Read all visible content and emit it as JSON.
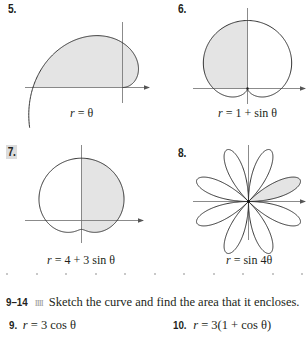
{
  "figures": [
    {
      "number": "5.",
      "caption_lhs": "r",
      "caption_rhs": " = θ",
      "equation": "r = θ",
      "shaded": "spiral region from θ=0 to θ=π"
    },
    {
      "number": "6.",
      "caption_lhs": "r",
      "caption_rhs": " = 1 + sin θ",
      "equation": "r = 1 + sin θ",
      "shaded": "left half (second quadrant part)"
    },
    {
      "number": "7.",
      "caption_lhs": "r",
      "caption_rhs": " = 4 + 3 sin θ",
      "equation": "r = 4 + 3 sin θ",
      "shaded": "right half"
    },
    {
      "number": "8.",
      "caption_lhs": "r",
      "caption_rhs": " = sin 4θ",
      "equation": "r = sin 4θ",
      "shaded": "one petal in first quadrant"
    }
  ],
  "exercise_header": {
    "range": "9–14",
    "separator": "IIII",
    "text": "Sketch the curve and find the area that it encloses."
  },
  "problems": [
    {
      "number": "9.",
      "lhs": "r",
      "rhs": " = 3 cos θ"
    },
    {
      "number": "10.",
      "lhs": "r",
      "rhs": " = 3(1 + cos θ)"
    }
  ],
  "colors": {
    "ink": "#231f20",
    "axis": "#6d6d6d",
    "fill": "#e4e4e4",
    "label_box": "#dcdcdc"
  }
}
